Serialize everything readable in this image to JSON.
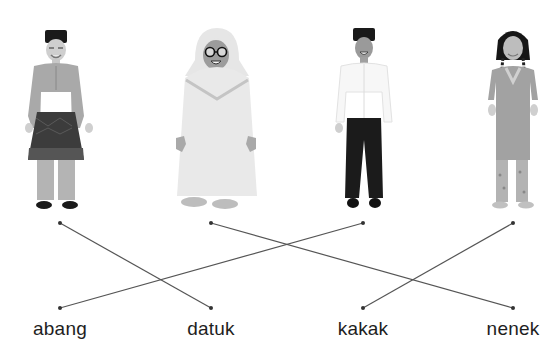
{
  "exercise": {
    "type": "matching",
    "figures": [
      {
        "id": "fig-1",
        "description": "old man in songkok and sampin",
        "x": 60
      },
      {
        "id": "fig-2",
        "description": "old woman in white telekung with glasses",
        "x": 211
      },
      {
        "id": "fig-3",
        "description": "young man in white shirt and black trousers",
        "x": 363
      },
      {
        "id": "fig-4",
        "description": "young woman with braids in long tunic",
        "x": 513
      }
    ],
    "labels": [
      {
        "text": "abang",
        "x": 60
      },
      {
        "text": "datuk",
        "x": 211
      },
      {
        "text": "kakak",
        "x": 363
      },
      {
        "text": "nenek",
        "x": 513
      }
    ],
    "top_dots_y": 223,
    "bottom_dots_y": 308,
    "connections": [
      {
        "from_figure": 0,
        "to_label": 1
      },
      {
        "from_figure": 1,
        "to_label": 3
      },
      {
        "from_figure": 2,
        "to_label": 0
      },
      {
        "from_figure": 3,
        "to_label": 2
      }
    ],
    "line_color": "#555555",
    "dot_color": "#333333"
  }
}
